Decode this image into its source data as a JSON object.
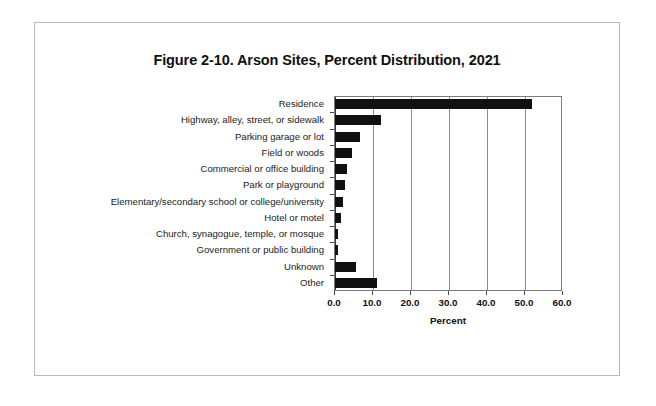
{
  "figure": {
    "title": "Figure 2-10. Arson Sites, Percent Distribution, 2021"
  },
  "chart_data": {
    "type": "bar",
    "orientation": "horizontal",
    "title": "Figure 2-10. Arson Sites, Percent Distribution, 2021",
    "xlabel": "Percent",
    "ylabel": "",
    "xlim": [
      0.0,
      60.0
    ],
    "xticks": [
      "0.0",
      "10.0",
      "20.0",
      "30.0",
      "40.0",
      "50.0",
      "60.0"
    ],
    "xtick_values": [
      0,
      10,
      20,
      30,
      40,
      50,
      60
    ],
    "grid": "vertical",
    "legend": "none",
    "bar_color": "#111111",
    "categories": [
      "Residence",
      "Highway, alley, street, or sidewalk",
      "Parking garage or lot",
      "Field or woods",
      "Commercial or office building",
      "Park or playground",
      "Elementary/secondary school or college/university",
      "Hotel or motel",
      "Church, synagogue, temple, or mosque",
      "Government or public building",
      "Unknown",
      "Other"
    ],
    "values": [
      51.8,
      12.1,
      6.5,
      4.5,
      3.1,
      2.6,
      2.0,
      1.5,
      0.9,
      0.8,
      5.5,
      11.0
    ]
  }
}
